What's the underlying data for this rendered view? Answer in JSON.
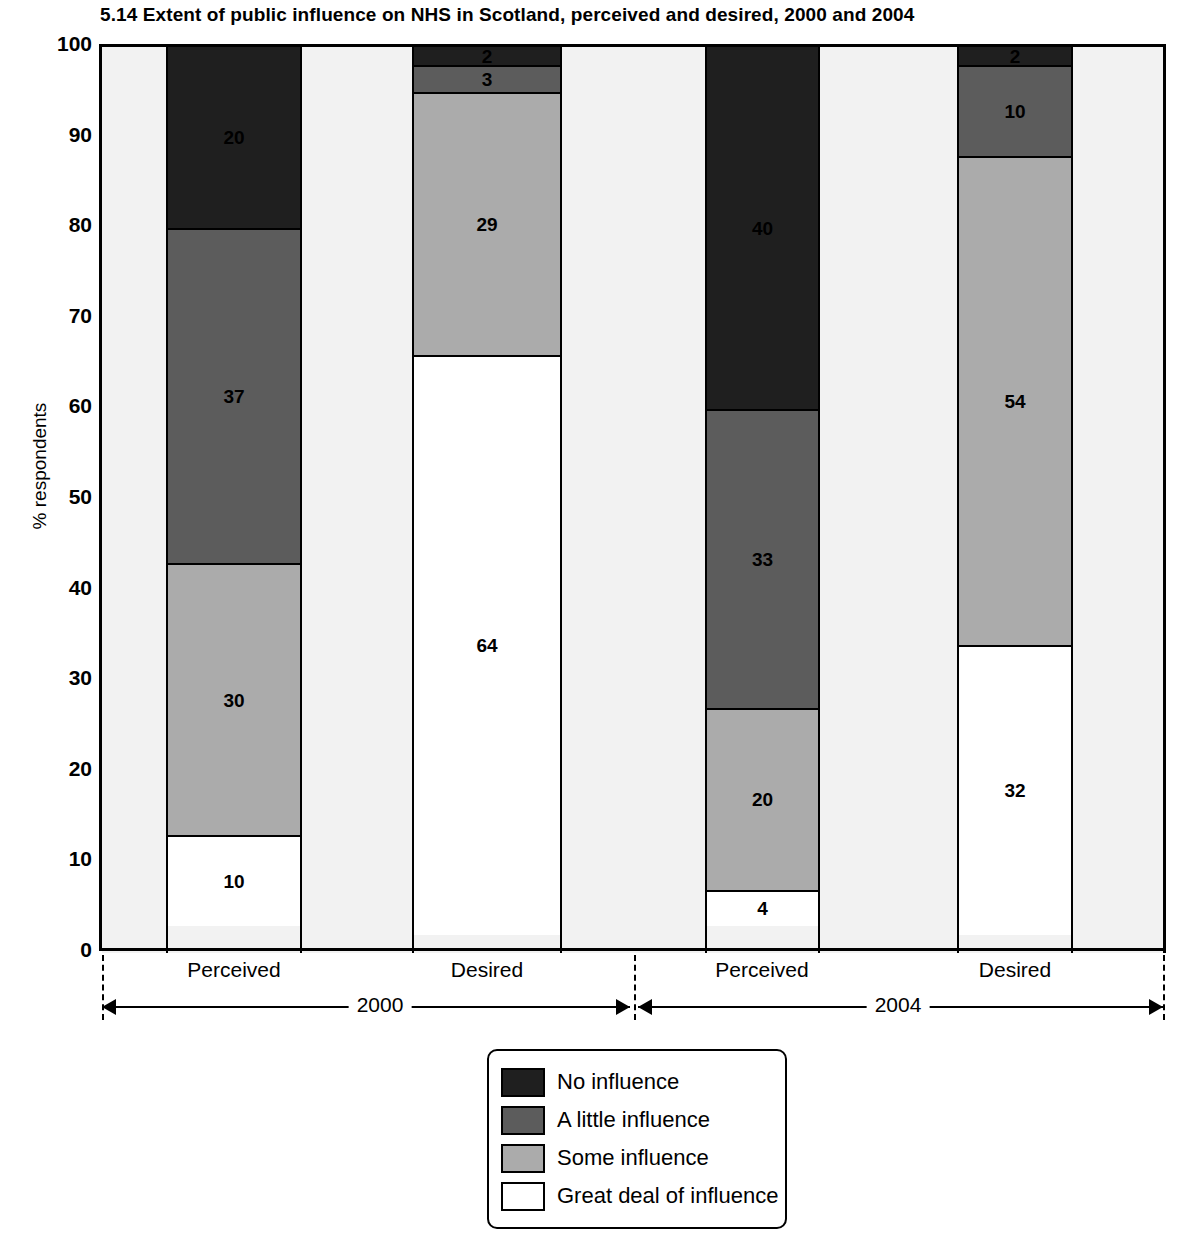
{
  "title": "5.14  Extent of public influence on NHS in Scotland, perceived and desired, 2000 and 2004",
  "axes": {
    "y_label": "% respondents",
    "y_ticks": [
      "100",
      "90",
      "80",
      "70",
      "60",
      "50",
      "40",
      "30",
      "20",
      "10",
      "0"
    ]
  },
  "groups": [
    {
      "label": "2000"
    },
    {
      "label": "2004"
    }
  ],
  "categories": [
    "Perceived",
    "Desired",
    "Perceived",
    "Desired"
  ],
  "legend": {
    "items": [
      {
        "label": "No influence",
        "color": "#1f1f1f"
      },
      {
        "label": "A little influence",
        "color": "#5c5c5c"
      },
      {
        "label": "Some influence",
        "color": "#ababab"
      },
      {
        "label": "Great deal of influence",
        "color": "#ffffff"
      }
    ]
  },
  "chart_data": {
    "type": "bar",
    "subtype": "stacked-vertical-100pct",
    "title": "5.14  Extent of public influence on NHS in Scotland, perceived and desired, 2000 and 2004",
    "xlabel": "",
    "ylabel": "% respondents",
    "ylim": [
      0,
      100
    ],
    "yticks": [
      0,
      10,
      20,
      30,
      40,
      50,
      60,
      70,
      80,
      90,
      100
    ],
    "grid": false,
    "legend_position": "bottom-center",
    "categories": [
      "Perceived",
      "Desired",
      "Perceived",
      "Desired"
    ],
    "groups": [
      "2000",
      "2000",
      "2004",
      "2004"
    ],
    "series": [
      {
        "name": "No influence",
        "color": "#1f1f1f",
        "values": [
          20,
          2,
          40,
          2
        ]
      },
      {
        "name": "A little influence",
        "color": "#5c5c5c",
        "values": [
          37,
          3,
          33,
          10
        ]
      },
      {
        "name": "Some influence",
        "color": "#ababab",
        "values": [
          30,
          29,
          20,
          54
        ]
      },
      {
        "name": "Great deal of influence",
        "color": "#ffffff",
        "values": [
          10,
          64,
          4,
          32
        ]
      }
    ]
  },
  "bars": [
    {
      "name": "perceived-2000",
      "left": 166,
      "width": 136,
      "segments": [
        {
          "label": "20",
          "value": 20,
          "color": "#1f1f1f",
          "text": "light-text"
        },
        {
          "label": "37",
          "value": 37,
          "color": "#5c5c5c",
          "text": "light-text"
        },
        {
          "label": "30",
          "value": 30,
          "color": "#ababab",
          "text": "dark-text"
        },
        {
          "label": "10",
          "value": 10,
          "color": "#ffffff",
          "text": "dark-text"
        }
      ]
    },
    {
      "name": "desired-2000",
      "left": 412,
      "width": 150,
      "segments": [
        {
          "label": "2",
          "value": 2,
          "color": "#1f1f1f",
          "text": "light-text"
        },
        {
          "label": "3",
          "value": 3,
          "color": "#5c5c5c",
          "text": "light-text"
        },
        {
          "label": "29",
          "value": 29,
          "color": "#ababab",
          "text": "dark-text"
        },
        {
          "label": "64",
          "value": 64,
          "color": "#ffffff",
          "text": "dark-text"
        }
      ]
    },
    {
      "name": "perceived-2004",
      "left": 705,
      "width": 115,
      "segments": [
        {
          "label": "40",
          "value": 40,
          "color": "#1f1f1f",
          "text": "light-text"
        },
        {
          "label": "33",
          "value": 33,
          "color": "#5c5c5c",
          "text": "light-text"
        },
        {
          "label": "20",
          "value": 20,
          "color": "#ababab",
          "text": "dark-text"
        },
        {
          "label": "4",
          "value": 4,
          "color": "#ffffff",
          "text": "dark-text"
        }
      ]
    },
    {
      "name": "desired-2004",
      "left": 957,
      "width": 116,
      "segments": [
        {
          "label": "2",
          "value": 2,
          "color": "#1f1f1f",
          "text": "light-text"
        },
        {
          "label": "10",
          "value": 10,
          "color": "#5c5c5c",
          "text": "light-text"
        },
        {
          "label": "54",
          "value": 54,
          "color": "#ababab",
          "text": "dark-text"
        },
        {
          "label": "32",
          "value": 32,
          "color": "#ffffff",
          "text": "dark-text"
        }
      ]
    }
  ],
  "layout": {
    "plot_left": 102,
    "plot_top": 44,
    "plot_width": 1061,
    "plot_height": 906,
    "cat_label_x": [
      234,
      487,
      762,
      1015
    ],
    "group_divider_x": [
      102,
      634,
      1163
    ],
    "brackets": [
      {
        "label": "2000",
        "left": 102,
        "right": 630,
        "label_x": 380
      },
      {
        "label": "2004",
        "left": 638,
        "right": 1163,
        "label_x": 898
      }
    ]
  }
}
